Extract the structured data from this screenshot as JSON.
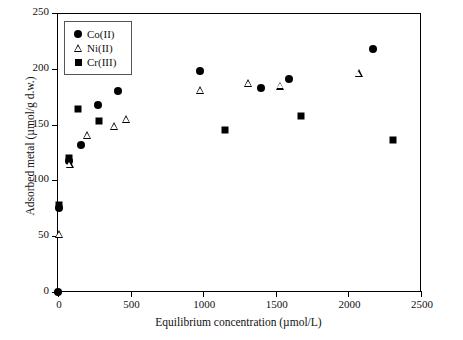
{
  "chart_data": {
    "type": "scatter",
    "title": "",
    "xlabel": "Equilibrium concentration (µmol/L)",
    "ylabel": "Adsorbed metal (µmol/g d.w.)",
    "xlim": [
      0,
      2500
    ],
    "ylim": [
      0,
      250
    ],
    "xticks": [
      0,
      500,
      1000,
      1500,
      2000,
      2500
    ],
    "yticks": [
      0,
      50,
      100,
      150,
      200,
      250
    ],
    "xtick_labels": [
      "0",
      "500",
      "1000",
      "1500",
      "2000",
      "2500"
    ],
    "ytick_labels": [
      "0",
      "50",
      "100",
      "150",
      "200",
      "250"
    ],
    "grid": false,
    "legend_position": "upper-left-inside",
    "series": [
      {
        "name": "Co(II)",
        "marker": "filled-circle",
        "color": "#000000",
        "points": [
          [
            0,
            0
          ],
          [
            8,
            75
          ],
          [
            75,
            117
          ],
          [
            160,
            132
          ],
          [
            275,
            168
          ],
          [
            415,
            180
          ],
          [
            980,
            198
          ],
          [
            1400,
            183
          ],
          [
            1590,
            191
          ],
          [
            2170,
            218
          ]
        ]
      },
      {
        "name": "Ni(II)",
        "marker": "open-triangle",
        "color": "#000000",
        "points": [
          [
            8,
            52
          ],
          [
            80,
            115
          ],
          [
            200,
            141
          ],
          [
            385,
            149
          ],
          [
            470,
            155
          ],
          [
            980,
            181
          ],
          [
            1310,
            187
          ],
          [
            1530,
            185
          ],
          [
            2070,
            196
          ]
        ]
      },
      {
        "name": "Cr(III)",
        "marker": "filled-square",
        "color": "#000000",
        "points": [
          [
            8,
            78
          ],
          [
            78,
            120
          ],
          [
            140,
            164
          ],
          [
            285,
            153
          ],
          [
            1150,
            145
          ],
          [
            1675,
            158
          ],
          [
            2310,
            136
          ]
        ]
      }
    ]
  },
  "legend": {
    "items": [
      {
        "label": "Co(II)",
        "marker": "filled-circle"
      },
      {
        "label": "Ni(II)",
        "marker": "open-triangle"
      },
      {
        "label": "Cr(III)",
        "marker": "filled-square"
      }
    ]
  }
}
